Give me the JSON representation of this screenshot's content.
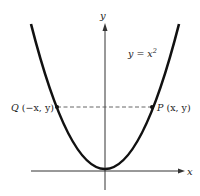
{
  "figure": {
    "axes": {
      "x_label": "x",
      "y_label": "y"
    },
    "curve": {
      "equation_lhs": "y = x",
      "equation_exp": "2",
      "color": "#111111"
    },
    "points": {
      "P": {
        "name": "P",
        "coords": "(x, y)"
      },
      "Q": {
        "name": "Q",
        "coords": "(−x, y)"
      }
    },
    "colors": {
      "axis": "#333333",
      "dash": "#555555",
      "background": "#ffffff"
    }
  }
}
